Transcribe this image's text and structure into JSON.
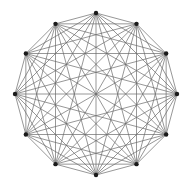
{
  "diagram": {
    "type": "complete-graph",
    "name": "K12",
    "vertex_count": 12,
    "layout": "regular-dodecagon",
    "center": [
      96,
      94
    ],
    "radius": 81,
    "start_angle_deg": 90,
    "colors": {
      "background": "#ffffff",
      "edge": "#6a6a6a",
      "vertex": "#1a1a1a"
    },
    "edge_width": 0.7,
    "vertex_radius": 2.2
  }
}
